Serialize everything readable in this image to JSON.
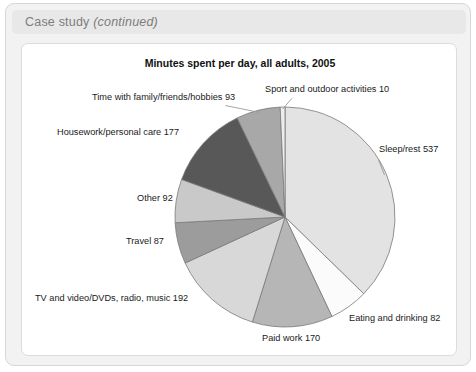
{
  "card": {
    "header_prefix": "Case study ",
    "header_emphasis": "(continued)"
  },
  "chart_data": {
    "type": "pie",
    "title": "Minutes spent per day, all adults, 2005",
    "xlabel": "",
    "ylabel": "",
    "total": 1440,
    "units": "minutes per day",
    "legend": "none",
    "labels_position": "outside-with-leader-lines",
    "start_angle_deg": 0,
    "direction": "clockwise",
    "categories": [
      "Sleep/rest",
      "Eating and drinking",
      "Paid work",
      "TV and video/DVDs, radio, music",
      "Travel",
      "Other",
      "Housework/personal care",
      "Time with family/friends/hobbies",
      "Sport and outdoor activities"
    ],
    "values": [
      537,
      82,
      170,
      192,
      87,
      92,
      177,
      93,
      10
    ],
    "colors": [
      "#e3e3e3",
      "#fbfbfb",
      "#b6b6b6",
      "#d8d8d8",
      "#9c9c9c",
      "#c9c9c9",
      "#585858",
      "#a8a8a8",
      "#ededed"
    ],
    "slice_labels": [
      "Sleep/rest 537",
      "Eating and drinking 82",
      "Paid work 170",
      "TV and video/DVDs, radio, music 192",
      "Travel 87",
      "Other 92",
      "Housework/personal care 177",
      "Time with family/friends/hobbies 93",
      "Sport and outdoor activities 10"
    ]
  },
  "labels": {
    "sport": "Sport and outdoor activities 10",
    "family": "Time with family/friends/hobbies 93",
    "housework": "Housework/personal care 177",
    "other": "Other 92",
    "travel": "Travel 87",
    "tv": "TV and video/DVDs, radio, music 192",
    "paid_work": "Paid work 170",
    "eating": "Eating and drinking 82",
    "sleep": "Sleep/rest 537"
  }
}
